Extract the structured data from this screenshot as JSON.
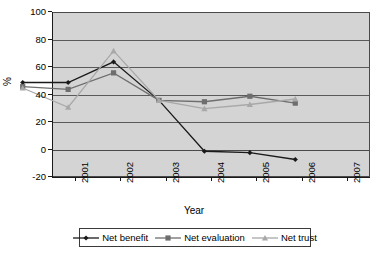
{
  "chart_data": {
    "type": "line",
    "title": "",
    "xlabel": "Year",
    "ylabel": "%",
    "categories": [
      "2001",
      "2002",
      "2003",
      "2004",
      "2005",
      "2006",
      "2007"
    ],
    "ylim": [
      -20,
      100
    ],
    "yticks": [
      -20,
      0,
      20,
      40,
      60,
      80,
      100
    ],
    "ytick_labels": [
      "-20",
      "0",
      "20",
      "40",
      "60",
      "80",
      "100"
    ],
    "grid": true,
    "legend_position": "bottom",
    "series": [
      {
        "name": "Net benefit",
        "marker": "diamond",
        "color": "#1a1a1a",
        "values": [
          40,
          40,
          55,
          27,
          -10,
          -11,
          -16
        ]
      },
      {
        "name": "Net evaluation",
        "marker": "square",
        "color": "#6e6e6e",
        "values": [
          37,
          35,
          47,
          27,
          26,
          30,
          25
        ]
      },
      {
        "name": "Net trust",
        "marker": "triangle",
        "color": "#a8a8a8",
        "values": [
          36,
          22,
          63,
          27,
          21,
          24,
          28
        ]
      }
    ]
  },
  "axes": {
    "y_title": "%",
    "x_title": "Year"
  },
  "legend": {
    "items": [
      {
        "label": "Net benefit"
      },
      {
        "label": "Net evaluation"
      },
      {
        "label": "Net trust"
      }
    ]
  }
}
